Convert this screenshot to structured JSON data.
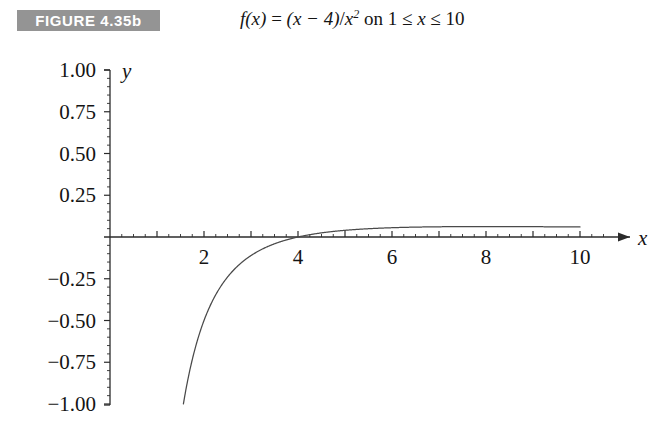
{
  "header": {
    "figure_badge": "FIGURE 4.35b",
    "badge_color": "#949494",
    "badge_text_color": "#ffffff",
    "caption_parts": {
      "fn": "f",
      "arg": "(x)",
      "eq": "=",
      "numerator": "(x − 4)",
      "slash": "/",
      "denom": "x",
      "exponent": "2",
      "on": "on",
      "domain_lo": "1",
      "le1": "≤",
      "var": "x",
      "le2": "≤",
      "domain_hi": "10"
    },
    "caption_plain": "f(x) = (x − 4)/x² on 1 ≤ x ≤ 10"
  },
  "axes": {
    "x_axis_label": "x",
    "y_axis_label": "y",
    "x_tick_labels": [
      "2",
      "4",
      "6",
      "8",
      "10"
    ],
    "x_tick_values": [
      2,
      4,
      6,
      8,
      10
    ],
    "y_tick_labels": [
      "1.00",
      "0.75",
      "0.50",
      "0.25",
      "−0.25",
      "−0.50",
      "−0.75",
      "−1.00"
    ],
    "y_tick_values": [
      1.0,
      0.75,
      0.5,
      0.25,
      -0.25,
      -0.5,
      -0.75,
      -1.0
    ],
    "axis_color": "#2b2b2b",
    "curve_color": "#4a4a4a"
  },
  "chart_data": {
    "type": "line",
    "xlabel": "x",
    "ylabel": "y",
    "xlim": [
      0,
      10.6
    ],
    "ylim": [
      -1.0,
      1.0
    ],
    "grid": false,
    "legend": "none",
    "function": "(x - 4) / x^2",
    "domain": [
      1,
      10
    ],
    "x_major_ticks": [
      1,
      2,
      3,
      4,
      5,
      6,
      7,
      8,
      9,
      10
    ],
    "x_minor_tick_step": 0.25,
    "y_major_ticks": [
      -1.0,
      -0.75,
      -0.5,
      -0.25,
      0.25,
      0.5,
      0.75,
      1.0
    ],
    "y_minor_tick_step": 0.05,
    "x_root": 4,
    "series": [
      {
        "name": "f(x) = (x-4)/x^2",
        "x": [
          1.732,
          1.8,
          1.9,
          2.0,
          2.2,
          2.4,
          2.6,
          2.8,
          3.0,
          3.2,
          3.4,
          3.6,
          3.8,
          4.0,
          4.2,
          4.5,
          5.0,
          5.5,
          6.0,
          6.5,
          7.0,
          7.5,
          8.0,
          8.5,
          9.0,
          9.5,
          10.0
        ],
        "y": [
          -1.0,
          -0.679,
          -0.582,
          -0.5,
          -0.372,
          -0.278,
          -0.207,
          -0.153,
          -0.111,
          -0.078,
          -0.052,
          -0.031,
          -0.014,
          0.0,
          0.011,
          0.025,
          0.04,
          0.05,
          0.056,
          0.059,
          0.061,
          0.062,
          0.063,
          0.062,
          0.062,
          0.061,
          0.06
        ]
      }
    ]
  }
}
